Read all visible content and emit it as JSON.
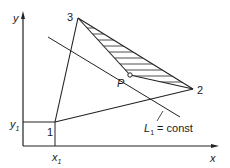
{
  "diagram": {
    "axes": {
      "x_label": "x",
      "y_label": "y",
      "x1_label": "x",
      "x1_sub": "1",
      "y1_label": "y",
      "y1_sub": "1"
    },
    "vertices": {
      "v1": "1",
      "v2": "2",
      "v3": "3"
    },
    "point_label": "P",
    "line_label": {
      "L": "L",
      "sub": "1",
      "rest": " = const"
    },
    "colors": {
      "stroke": "#222222",
      "background": "#ffffff"
    }
  }
}
